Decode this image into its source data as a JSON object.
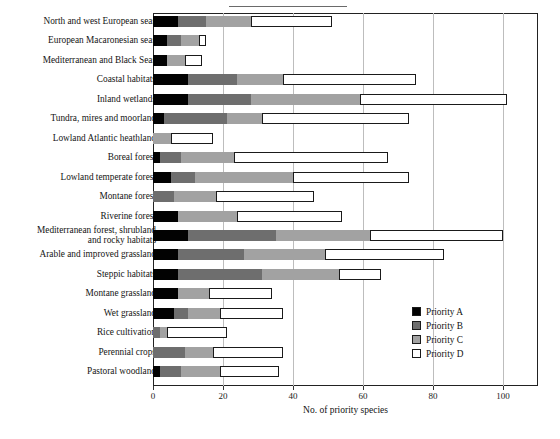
{
  "chart_data": {
    "type": "bar",
    "orientation": "horizontal",
    "stacked": true,
    "title": "",
    "xlabel": "No. of priority species",
    "ylabel": "",
    "xlim": [
      0,
      110
    ],
    "xticks": [
      0,
      20,
      40,
      60,
      80,
      100
    ],
    "xtick_labels": [
      "0",
      "20",
      "40",
      "60",
      "80",
      "100"
    ],
    "grid": "vertical",
    "legend_position": "right-inside",
    "legend": [
      "Priority A",
      "Priority B",
      "Priority C",
      "Priority D"
    ],
    "series": [
      {
        "name": "Priority A",
        "color": "#020202",
        "values": [
          7,
          4,
          4,
          10,
          10,
          3,
          0,
          2,
          5,
          0,
          7,
          10,
          7,
          7,
          7,
          6,
          0,
          0,
          2
        ]
      },
      {
        "name": "Priority B",
        "color": "#6e6e6e",
        "values": [
          8,
          4,
          0,
          14,
          18,
          18,
          0,
          6,
          7,
          6,
          0,
          25,
          19,
          24,
          0,
          4,
          2,
          9,
          6
        ]
      },
      {
        "name": "Priority C",
        "color": "#a2a2a2",
        "values": [
          13,
          5,
          5,
          13,
          31,
          10,
          5,
          15,
          28,
          12,
          17,
          27,
          23,
          22,
          9,
          9,
          2,
          8,
          11
        ]
      },
      {
        "name": "Priority D",
        "color": "#ffffff",
        "values": [
          23,
          2,
          5,
          38,
          42,
          42,
          12,
          44,
          33,
          28,
          30,
          38,
          34,
          12,
          18,
          18,
          17,
          20,
          17
        ]
      }
    ],
    "categories": [
      "North and west European seas",
      "European Macaronesian seas",
      "Mediterranean and Black Seas",
      "Coastal habitats",
      "Inland wetlands",
      "Tundra, mires and moorland",
      "Lowland Atlantic heathland",
      "Boreal forest",
      "Lowland temperate forest",
      "Montane forest",
      "Riverine forest",
      "Mediterranean forest, shrubland\nand rocky habitats",
      "Arable and improved grassland",
      "Steppic habitats",
      "Montane grassland",
      "Wet grassland",
      "Rice cultivation",
      "Perennial crops",
      "Pastoral woodland"
    ],
    "totals": [
      51,
      15,
      14,
      75,
      101,
      73,
      17,
      67,
      73,
      46,
      54,
      100,
      83,
      65,
      34,
      37,
      21,
      37,
      36
    ]
  },
  "axis": {
    "xlabel": "No. of priority species",
    "ticks": [
      "0",
      "20",
      "40",
      "60",
      "80",
      "100"
    ]
  },
  "legend": {
    "items": [
      {
        "label": "Priority A",
        "color": "#020202"
      },
      {
        "label": "Priority B",
        "color": "#6e6e6e"
      },
      {
        "label": "Priority C",
        "color": "#a2a2a2"
      },
      {
        "label": "Priority D",
        "color": "#ffffff"
      }
    ]
  }
}
